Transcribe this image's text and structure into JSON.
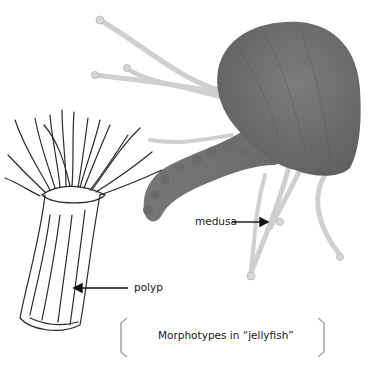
{
  "figure": {
    "caption": "Morphotypes in “jellyfish”",
    "labels": {
      "medusa": "medusa",
      "polyp": "polyp"
    },
    "colors": {
      "medusa_bell": "#6e6e6e",
      "medusa_arms": "#7a7a7a",
      "tentacles": "#d4d4d4",
      "polyp_ink": "#2a2a2a",
      "bracket": "#aaaaaa",
      "text": "#1a1a1a"
    }
  }
}
